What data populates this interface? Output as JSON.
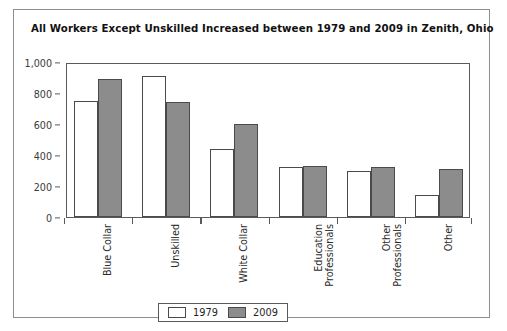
{
  "chart_data": {
    "type": "bar",
    "title": "All Workers Except Unskilled Increased between 1979 and 2009 in Zenith, Ohio",
    "xlabel": "",
    "ylabel": "",
    "ylim": [
      0,
      1000
    ],
    "yticks": [
      "0",
      "200",
      "400",
      "600",
      "800",
      "1,000"
    ],
    "ytick_values": [
      0,
      200,
      400,
      600,
      800,
      1000
    ],
    "grid": false,
    "legend_position": "bottom-center",
    "categories": [
      "Blue Collar",
      "Unskilled",
      "White Collar",
      "Education Professionals",
      "Other Professionals",
      "Other"
    ],
    "category_lines": [
      [
        "Blue Collar"
      ],
      [
        "Unskilled"
      ],
      [
        "White Collar"
      ],
      [
        "Education",
        "Professionals"
      ],
      [
        "Other",
        "Professionals"
      ],
      [
        "Other"
      ]
    ],
    "series": [
      {
        "name": "1979",
        "color": "#ffffff",
        "values": [
          750,
          910,
          440,
          320,
          300,
          140
        ]
      },
      {
        "name": "2009",
        "color": "#8c8c8c",
        "values": [
          890,
          740,
          600,
          330,
          320,
          310
        ]
      }
    ]
  },
  "legend": {
    "entries": [
      {
        "label": "1979"
      },
      {
        "label": "2009"
      }
    ]
  }
}
